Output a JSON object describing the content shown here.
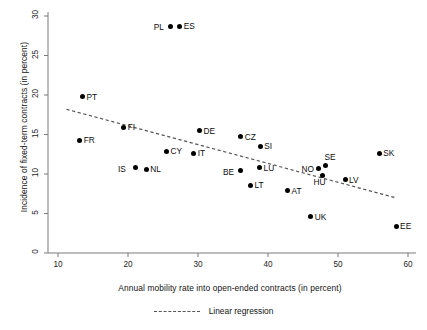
{
  "chart_data": {
    "type": "scatter",
    "title": "",
    "xlabel": "Annual mobility rate into open-ended contracts (in percent)",
    "ylabel": "Incidence of fixed-term contracts (in percent)",
    "xlim": [
      9.0,
      61.5
    ],
    "ylim": [
      -0.6,
      31.0
    ],
    "xticks": [
      10,
      20,
      30,
      40,
      50,
      60
    ],
    "xtick_labels": [
      "10",
      "20",
      "30",
      "40",
      "50",
      "60"
    ],
    "yticks": [
      0,
      5,
      10,
      15,
      20,
      25,
      30
    ],
    "ytick_labels": [
      "0",
      "5",
      "10",
      "15",
      "20",
      "25",
      "30"
    ],
    "grid": false,
    "legend_position": "below-axes",
    "marker_color": "#000000",
    "regression_color": "#555555",
    "points": [
      {
        "label": "PL",
        "x": 26.1,
        "y": 28.7,
        "label_pos": "left"
      },
      {
        "label": "ES",
        "x": 27.4,
        "y": 28.7,
        "label_pos": "right"
      },
      {
        "label": "PT",
        "x": 13.5,
        "y": 19.8,
        "label_pos": "right"
      },
      {
        "label": "FI",
        "x": 19.4,
        "y": 15.9,
        "label_pos": "right"
      },
      {
        "label": "FR",
        "x": 13.1,
        "y": 14.3,
        "label_pos": "right"
      },
      {
        "label": "DE",
        "x": 30.2,
        "y": 15.5,
        "label_pos": "right"
      },
      {
        "label": "CZ",
        "x": 36.1,
        "y": 14.7,
        "label_pos": "right"
      },
      {
        "label": "SI",
        "x": 38.9,
        "y": 13.5,
        "label_pos": "right"
      },
      {
        "label": "CY",
        "x": 25.5,
        "y": 12.9,
        "label_pos": "right"
      },
      {
        "label": "IT",
        "x": 29.4,
        "y": 12.6,
        "label_pos": "right"
      },
      {
        "label": "SK",
        "x": 55.9,
        "y": 12.6,
        "label_pos": "right"
      },
      {
        "label": "SE",
        "x": 48.2,
        "y": 11.1,
        "label_pos": "above-right"
      },
      {
        "label": "NO",
        "x": 47.2,
        "y": 10.7,
        "label_pos": "left"
      },
      {
        "label": "IS",
        "x": 21.0,
        "y": 10.8,
        "label_pos": "left"
      },
      {
        "label": "NL",
        "x": 22.6,
        "y": 10.6,
        "label_pos": "right"
      },
      {
        "label": "LU",
        "x": 38.8,
        "y": 10.8,
        "label_pos": "right"
      },
      {
        "label": "BE",
        "x": 36.0,
        "y": 10.4,
        "label_pos": "left"
      },
      {
        "label": "LV",
        "x": 51.0,
        "y": 9.3,
        "label_pos": "right"
      },
      {
        "label": "HU",
        "x": 47.8,
        "y": 9.8,
        "label_pos": "below"
      },
      {
        "label": "LT",
        "x": 37.5,
        "y": 8.6,
        "label_pos": "right"
      },
      {
        "label": "AT",
        "x": 42.8,
        "y": 7.9,
        "label_pos": "right"
      },
      {
        "label": "UK",
        "x": 46.1,
        "y": 4.6,
        "label_pos": "right"
      },
      {
        "label": "EE",
        "x": 58.3,
        "y": 3.4,
        "label_pos": "right"
      }
    ],
    "regression": {
      "name": "Linear regression",
      "style": "dashed",
      "x_start": 11.2,
      "y_start": 18.2,
      "x_end": 58.2,
      "y_end": 7.0
    }
  },
  "legend": {
    "entries": [
      {
        "label": "Linear regression",
        "style": "dashed",
        "color": "#555555"
      }
    ]
  }
}
